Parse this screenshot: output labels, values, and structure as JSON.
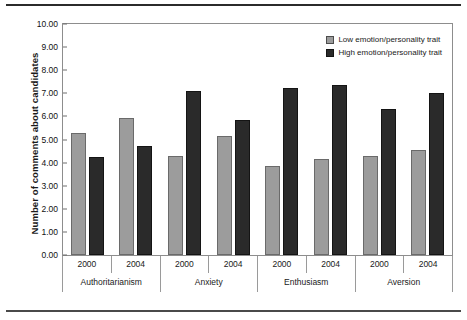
{
  "chart_data": {
    "type": "bar",
    "title": "",
    "xlabel": "",
    "ylabel": "Number of comments about candidates",
    "ylim": [
      0,
      10
    ],
    "ytick_step": 1,
    "ytick_labels": [
      "10.00",
      "9.00",
      "8.00",
      "7.00",
      "6.00",
      "5.00",
      "4.00",
      "3.00",
      "2.00",
      "1.00",
      "0.00"
    ],
    "grid": false,
    "legend_position": "top-right",
    "group_labels": [
      "Authoritarianism",
      "Anxiety",
      "Enthusiasm",
      "Aversion"
    ],
    "subgroup_labels": [
      "2000",
      "2004"
    ],
    "categories": [
      "Authoritarianism 2000",
      "Authoritarianism 2004",
      "Anxiety 2000",
      "Anxiety 2004",
      "Enthusiasm 2000",
      "Enthusiasm 2004",
      "Aversion 2000",
      "Aversion 2004"
    ],
    "series": [
      {
        "name": "Low emotion/personality trait",
        "color": "#9c9c9c",
        "values": [
          5.25,
          5.9,
          4.25,
          5.1,
          3.8,
          4.1,
          4.25,
          4.5
        ]
      },
      {
        "name": "High emotion/personality trait",
        "color": "#2a2a2a",
        "values": [
          4.2,
          4.7,
          7.05,
          5.8,
          7.15,
          7.3,
          6.25,
          6.95
        ]
      }
    ]
  },
  "legend": {
    "items": [
      {
        "label": "Low emotion/personality trait",
        "swatch": "low"
      },
      {
        "label": "High emotion/personality trait",
        "swatch": "high"
      }
    ]
  },
  "axis": {
    "groups": [
      {
        "label": "Authoritarianism",
        "years": [
          "2000",
          "2004"
        ]
      },
      {
        "label": "Anxiety",
        "years": [
          "2000",
          "2004"
        ]
      },
      {
        "label": "Enthusiasm",
        "years": [
          "2000",
          "2004"
        ]
      },
      {
        "label": "Aversion",
        "years": [
          "2000",
          "2004"
        ]
      }
    ]
  }
}
